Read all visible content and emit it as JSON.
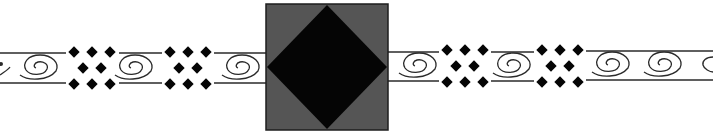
{
  "figure": {
    "background": "#ffffff",
    "band": {
      "top_y": 53,
      "bottom_y": 83,
      "line_color": "#2a2a2a"
    },
    "medallion": {
      "x": 266,
      "y": 4,
      "width": 122,
      "height": 126,
      "fill": "#555555",
      "border": "#1e1e1e",
      "diamond_fill": "#050505"
    },
    "motifs_left": [
      {
        "type": "spiral",
        "cx": 38
      },
      {
        "type": "diamond-cluster",
        "cx": 92
      },
      {
        "type": "spiral",
        "cx": 133
      },
      {
        "type": "diamond-cluster",
        "cx": 188
      },
      {
        "type": "spiral",
        "cx": 240
      }
    ],
    "motifs_right": [
      {
        "type": "spiral",
        "cx": 417
      },
      {
        "type": "diamond-cluster",
        "cx": 465
      },
      {
        "type": "spiral",
        "cx": 511
      },
      {
        "type": "diamond-cluster",
        "cx": 560
      },
      {
        "type": "spiral",
        "cx": 610
      },
      {
        "type": "spiral",
        "cx": 662
      },
      {
        "type": "spiral-partial",
        "cx": 705
      }
    ],
    "icon_names": {
      "spiral": "spiral-icon",
      "diamond-cluster": "diamond-cluster-icon"
    }
  }
}
